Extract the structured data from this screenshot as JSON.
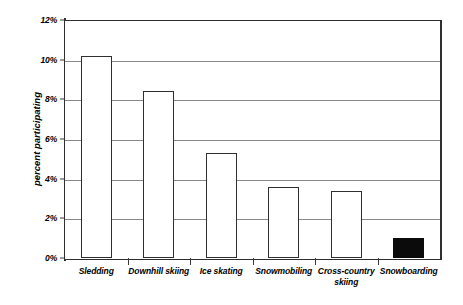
{
  "chart_data": {
    "type": "bar",
    "title": "",
    "subtitle": "",
    "xlabel": "",
    "ylabel": "percent participating",
    "categories": [
      "Sledding",
      "Downhill skiing",
      "Ice skating",
      "Snowmobiling",
      "Cross-country skiing",
      "Snowboarding"
    ],
    "values": [
      10.2,
      8.4,
      5.3,
      3.6,
      3.4,
      1.0
    ],
    "ylim": [
      0,
      12
    ],
    "ytick_values": [
      0,
      2,
      4,
      6,
      8,
      10,
      12
    ],
    "ytick_labels": [
      "0%",
      "2%",
      "4%",
      "6%",
      "8%",
      "10%",
      "12%"
    ],
    "grid": true,
    "legend": false,
    "legend_position": "none",
    "bar_styles": [
      "outline",
      "outline",
      "outline",
      "outline",
      "outline",
      "filled"
    ],
    "colors": {
      "bar_outline": "#2f2f2f",
      "bar_fill": "#ffffff",
      "bar_highlight_fill": "#0b0b0b",
      "gridline": "#8a8a8a",
      "axis": "#2f2f2f",
      "background": "#ffffff",
      "text": "#000000"
    }
  }
}
